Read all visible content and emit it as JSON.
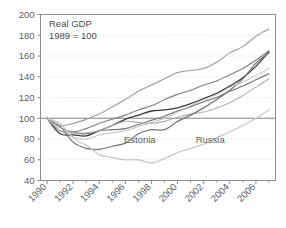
{
  "figure": {
    "background_color": "#ffffff",
    "plot_background_color": "#ffffff",
    "frame_color": "#8c8c8c",
    "gridline_color": "#d6d6d6",
    "text_color": "#5d5d5d"
  },
  "chart_data": {
    "type": "line",
    "title": "Real GDP",
    "subtitle": "1989 = 100",
    "xlabel": "",
    "ylabel": "",
    "xlim": [
      1989.5,
      2007.5
    ],
    "ylim": [
      40,
      200
    ],
    "yticks": [
      40,
      60,
      80,
      100,
      120,
      140,
      160,
      180,
      200
    ],
    "ytick_labels": [
      "40",
      "60",
      "80",
      "100",
      "120",
      "140",
      "160",
      "180",
      "200"
    ],
    "xticks": [
      1990,
      1992,
      1994,
      1996,
      1998,
      2000,
      2002,
      2004,
      2006
    ],
    "xtick_labels": [
      "1990",
      "1992",
      "1994",
      "1996",
      "1998",
      "2000",
      "2002",
      "2004",
      "2006"
    ],
    "minor_xticks": [
      1991,
      1993,
      1995,
      1997,
      1999,
      2001,
      2003,
      2005,
      2007
    ],
    "grid": "horizontal-dotted",
    "legend": "inline-annotations",
    "reference_line": 100,
    "x": [
      1990,
      1991,
      1992,
      1993,
      1994,
      1995,
      1996,
      1997,
      1998,
      1999,
      2000,
      2001,
      2002,
      2003,
      2004,
      2005,
      2006,
      2007
    ],
    "series": [
      {
        "name": "Poland",
        "annotation": "",
        "color": "#9a9a9a",
        "width": 1.1,
        "values": [
          100,
          93,
          95,
          99,
          104,
          111,
          118,
          126,
          132,
          138,
          144,
          146,
          148,
          154,
          163,
          169,
          179,
          186
        ]
      },
      {
        "name": "Slovenia",
        "annotation": "",
        "color": "#7d7d7d",
        "width": 1.1,
        "values": [
          100,
          91,
          87,
          90,
          95,
          99,
          103,
          108,
          112,
          118,
          123,
          127,
          132,
          136,
          142,
          148,
          156,
          165
        ]
      },
      {
        "name": "Slovakia",
        "annotation": "",
        "color": "#3a3a3a",
        "width": 1.3,
        "values": [
          100,
          85,
          84,
          83,
          88,
          93,
          99,
          103,
          107,
          108,
          110,
          114,
          119,
          124,
          131,
          139,
          150,
          164
        ]
      },
      {
        "name": "Hungary",
        "annotation": "",
        "color": "#6e6e6e",
        "width": 1.1,
        "values": [
          100,
          88,
          86,
          85,
          88,
          89,
          90,
          94,
          98,
          102,
          107,
          111,
          116,
          120,
          126,
          131,
          137,
          143
        ]
      },
      {
        "name": "Czech Republic",
        "annotation": "",
        "color": "#b0b0b0",
        "width": 1.1,
        "values": [
          100,
          88,
          86,
          86,
          88,
          93,
          97,
          96,
          95,
          97,
          101,
          104,
          106,
          110,
          115,
          122,
          130,
          138
        ]
      },
      {
        "name": "Estonia",
        "annotation": "Estonia",
        "annotation_x": 1997.1,
        "annotation_y": 76,
        "color": "#747474",
        "width": 1.2,
        "values": [
          100,
          92,
          77,
          71,
          70,
          73,
          76,
          85,
          89,
          89,
          97,
          103,
          110,
          118,
          127,
          138,
          153,
          163
        ]
      },
      {
        "name": "Russia",
        "annotation": "Russia",
        "annotation_x": 2002.5,
        "annotation_y": 76,
        "color": "#c9c9c9",
        "width": 1.3,
        "values": [
          100,
          95,
          81,
          74,
          65,
          62,
          60,
          60,
          57,
          61,
          67,
          71,
          75,
          81,
          87,
          93,
          100,
          108
        ]
      },
      {
        "name": "Ukraine",
        "annotation": "",
        "color": "#bdbdbd",
        "width": 1.0,
        "values": [
          100,
          91,
          82,
          80,
          84,
          86,
          88,
          92,
          96,
          100,
          106,
          112,
          118,
          123,
          130,
          135,
          141,
          148
        ]
      }
    ]
  }
}
